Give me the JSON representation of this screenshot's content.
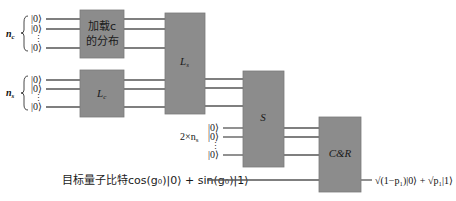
{
  "registers": {
    "n_c": {
      "label": "n",
      "subscript": "c",
      "kets": [
        "|0⟩",
        "|0⟩",
        "⋮",
        "|0⟩"
      ]
    },
    "n_s": {
      "label": "n",
      "subscript": "s",
      "kets": [
        "|0⟩",
        "|0⟩",
        "⋮",
        "|0⟩"
      ]
    },
    "ancilla": {
      "label": "2×n",
      "subscript": "s",
      "kets": [
        "|0⟩",
        "|0⟩",
        "⋮",
        "|0⟩"
      ]
    },
    "target": {
      "label": "目标量子比特cos(g₀)|0⟩ + sin(g₀)|1⟩"
    }
  },
  "gates": {
    "load": {
      "line1": "加载c",
      "line2": "的分布"
    },
    "Lc": {
      "label": "L",
      "subscript": "c"
    },
    "Ls": {
      "label": "L",
      "subscript": "s"
    },
    "S": {
      "label": "S"
    },
    "CR": {
      "label": "C&R"
    }
  },
  "output": {
    "label": "√(1−p₁)|0⟩ + √p₁|1⟩"
  },
  "colors": {
    "gate_fill": "#8c8c8c",
    "wire": "#555555",
    "background": "#ffffff"
  }
}
